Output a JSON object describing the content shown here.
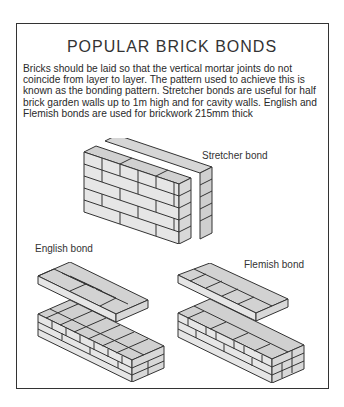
{
  "document": {
    "title": "POPULAR BRICK BONDS",
    "body": "Bricks should be laid so that the vertical mortar joints do not coincide from layer to layer. The pattern used to achieve this is known as the bonding pattern. Stretcher bonds are useful for half brick garden walls up to 1m high and for cavity walls. English and Flemish bonds are used for brickwork 215mm thick",
    "illustrations": [
      {
        "id": "stretcher",
        "label": "Stretcher bond"
      },
      {
        "id": "english",
        "label": "English bond"
      },
      {
        "id": "flemish",
        "label": "Flemish bond"
      }
    ]
  },
  "colors": {
    "brick_face": "#e4e4e4",
    "brick_top": "#d0d0d0",
    "mortar": "#333333",
    "frame": "#333333"
  }
}
